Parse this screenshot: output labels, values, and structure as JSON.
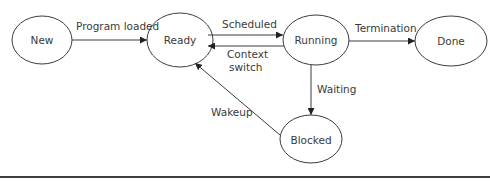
{
  "diagram": {
    "nodes": {
      "new": "New",
      "ready": "Ready",
      "running": "Running",
      "done": "Done",
      "blocked": "Blocked"
    },
    "edges": {
      "program_loaded": "Program loaded",
      "scheduled": "Scheduled",
      "context_switch_line1": "Context",
      "context_switch_line2": "switch",
      "termination": "Termination",
      "waiting": "Waiting",
      "wakeup": "Wakeup"
    },
    "colors": {
      "stroke": "#3c3c3c",
      "text": "#3a3a3a",
      "background": "#ffffff"
    }
  }
}
